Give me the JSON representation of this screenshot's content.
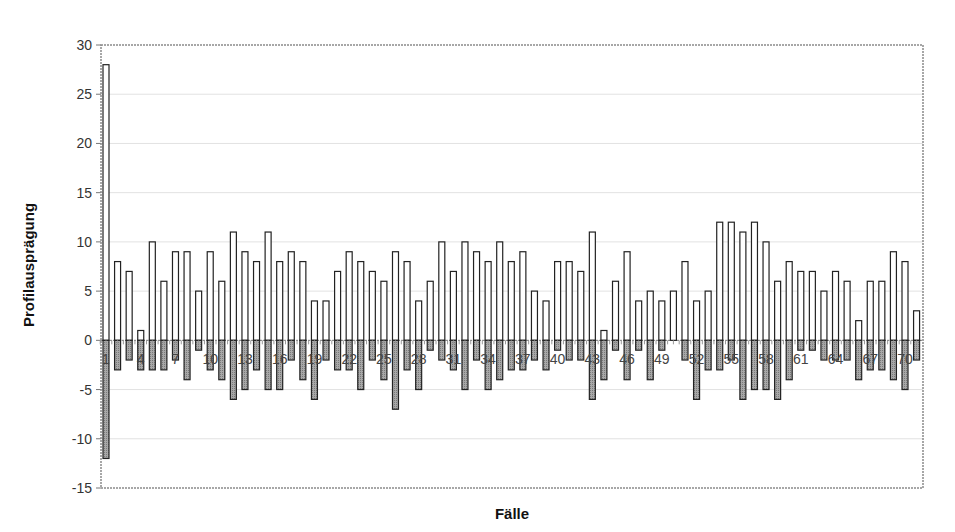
{
  "chart_data": {
    "type": "bar",
    "title": "",
    "xlabel": "Fälle",
    "ylabel": "Profilausprägung",
    "ylim": [
      -15,
      30
    ],
    "yticks": [
      30,
      25,
      20,
      15,
      10,
      5,
      0,
      -5,
      -10,
      -15
    ],
    "xtick_labels": [
      "1",
      "4",
      "7",
      "10",
      "13",
      "16",
      "19",
      "22",
      "25",
      "28",
      "31",
      "34",
      "37",
      "40",
      "43",
      "46",
      "49",
      "52",
      "55",
      "58",
      "61",
      "64",
      "67",
      "70"
    ],
    "grid": true,
    "legend": null,
    "categories": [
      1,
      2,
      3,
      4,
      5,
      6,
      7,
      8,
      9,
      10,
      11,
      12,
      13,
      14,
      15,
      16,
      17,
      18,
      19,
      20,
      21,
      22,
      23,
      24,
      25,
      26,
      27,
      28,
      29,
      30,
      31,
      32,
      33,
      34,
      35,
      36,
      37,
      38,
      39,
      40,
      41,
      42,
      43,
      44,
      45,
      46,
      47,
      48,
      49,
      50,
      51,
      52,
      53,
      54,
      55,
      56,
      57,
      58,
      59,
      60,
      61,
      62,
      63,
      64,
      65,
      66,
      67,
      68,
      69,
      70,
      71
    ],
    "series": [
      {
        "name": "positiv",
        "color": "#ffffff",
        "values": [
          28,
          8,
          7,
          1,
          10,
          6,
          9,
          9,
          5,
          9,
          6,
          11,
          9,
          8,
          11,
          8,
          9,
          8,
          4,
          4,
          7,
          9,
          8,
          7,
          6,
          9,
          8,
          4,
          6,
          10,
          7,
          10,
          9,
          8,
          10,
          8,
          9,
          5,
          4,
          8,
          8,
          7,
          11,
          1,
          6,
          9,
          4,
          5,
          4,
          5,
          8,
          4,
          5,
          12,
          12,
          11,
          12,
          10,
          6,
          8,
          7,
          7,
          5,
          7,
          6,
          2,
          6,
          6,
          9,
          8,
          3
        ]
      },
      {
        "name": "negativ",
        "color": "#9a9a9a",
        "values": [
          -12,
          -3,
          -2,
          -3,
          -3,
          -3,
          -2,
          -4,
          -1,
          -3,
          -4,
          -6,
          -5,
          -3,
          -5,
          -5,
          -2,
          -4,
          -6,
          -2,
          -3,
          -3,
          -5,
          -2,
          -4,
          -7,
          -3,
          -5,
          -1,
          -2,
          -3,
          -5,
          -2,
          -5,
          -4,
          -3,
          -3,
          -2,
          -3,
          -1,
          -2,
          -2,
          -6,
          -4,
          -1,
          -4,
          -1,
          -4,
          -1,
          0,
          -2,
          -6,
          -3,
          -3,
          -2,
          -6,
          -5,
          -5,
          -6,
          -4,
          -1,
          -1,
          -2,
          -2,
          -2,
          -4,
          -3,
          -3,
          -4,
          -5,
          -2
        ]
      }
    ]
  },
  "axis": {
    "x_title": "Fälle",
    "y_title": "Profilausprägung"
  }
}
